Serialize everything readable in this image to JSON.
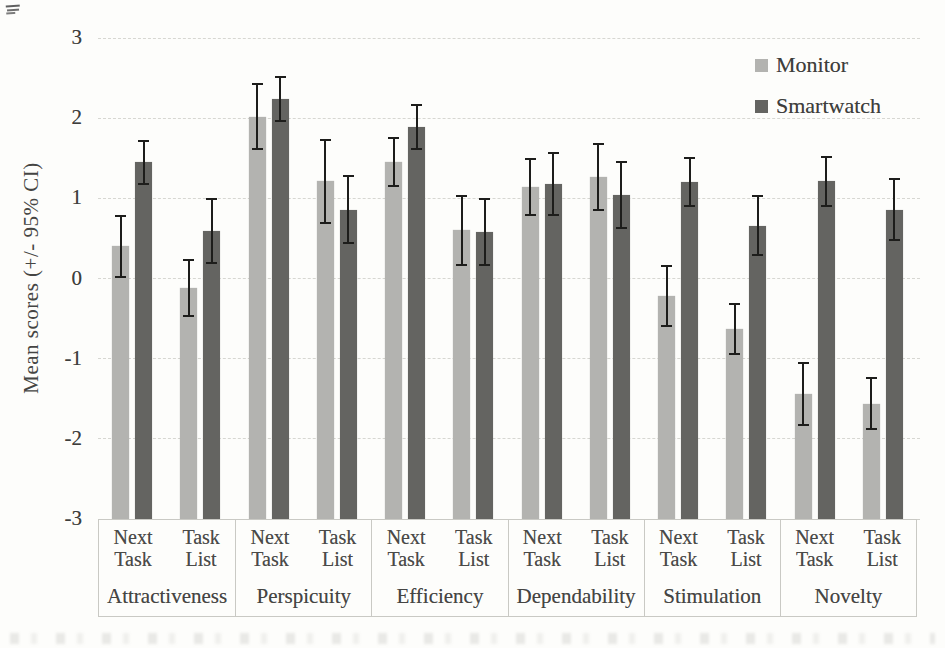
{
  "figure": {
    "type_note": "scanned bar chart figure",
    "background": "#fdfdfb",
    "error_bar_color": "#1d1d1b"
  },
  "chart_data": {
    "type": "bar",
    "title": "",
    "xlabel": "",
    "ylabel": "Mean scores (+/- 95% CI)",
    "ylim": [
      -3,
      3
    ],
    "y_ticks": [
      3,
      2,
      1,
      0,
      -1,
      -2,
      -3
    ],
    "y_tick_labels": [
      "3",
      "2",
      "1",
      "0",
      "-1",
      "-2",
      "-3"
    ],
    "bar_base": -3,
    "grid": true,
    "error_bars": "95% CI",
    "legend_position": "top-right",
    "categories": [
      "Attractiveness",
      "Perspicuity",
      "Efficiency",
      "Dependability",
      "Stimulation",
      "Novelty"
    ],
    "subgroups": [
      "Next Task",
      "Task List"
    ],
    "series": [
      {
        "name": "Monitor",
        "color": "#b3b3b0",
        "values": [
          [
            0.4,
            -0.12
          ],
          [
            2.02,
            1.21
          ],
          [
            1.45,
            0.6
          ],
          [
            1.14,
            1.27
          ],
          [
            -0.22,
            -0.63
          ],
          [
            -1.44,
            -1.56
          ]
        ],
        "ci": [
          [
            0.38,
            0.35
          ],
          [
            0.4,
            0.52
          ],
          [
            0.3,
            0.43
          ],
          [
            0.35,
            0.41
          ],
          [
            0.37,
            0.31
          ],
          [
            0.39,
            0.32
          ]
        ]
      },
      {
        "name": "Smartwatch",
        "color": "#646461",
        "values": [
          [
            1.45,
            0.59
          ],
          [
            2.24,
            0.86
          ],
          [
            1.89,
            0.58
          ],
          [
            1.18,
            1.04
          ],
          [
            1.2,
            0.66
          ],
          [
            1.21,
            0.86
          ]
        ],
        "ci": [
          [
            0.27,
            0.4
          ],
          [
            0.27,
            0.42
          ],
          [
            0.28,
            0.41
          ],
          [
            0.39,
            0.41
          ],
          [
            0.3,
            0.37
          ],
          [
            0.31,
            0.38
          ]
        ]
      }
    ]
  }
}
